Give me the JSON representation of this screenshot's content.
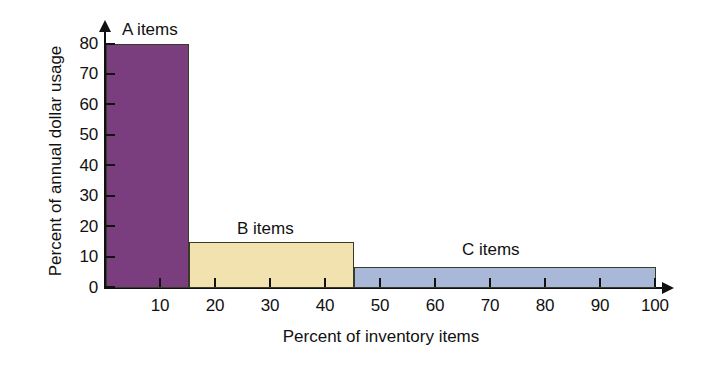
{
  "chart_data": {
    "type": "bar",
    "title": "",
    "subtitle": "",
    "xlabel": "Percent of inventory items",
    "ylabel": "Percent of annual dollar usage",
    "xlim": [
      0,
      100
    ],
    "ylim": [
      0,
      80
    ],
    "xticks": [
      10,
      20,
      30,
      40,
      50,
      60,
      70,
      80,
      90,
      100
    ],
    "yticks": [
      0,
      10,
      20,
      30,
      40,
      50,
      60,
      70,
      80
    ],
    "grid": false,
    "legend": false,
    "orientation": "vertical",
    "bars": [
      {
        "label": "A items",
        "x_start": 0,
        "x_end": 15,
        "width": 15,
        "value": 80,
        "color": "#7a3d7d"
      },
      {
        "label": "B items",
        "x_start": 15,
        "x_end": 45,
        "width": 30,
        "value": 15,
        "color": "#f2e2b0"
      },
      {
        "label": "C items",
        "x_start": 45,
        "x_end": 100,
        "width": 55,
        "value": 7,
        "color": "#a9b7d9"
      }
    ],
    "categories": [
      "A items",
      "B items",
      "C items"
    ],
    "values": [
      80,
      15,
      7
    ],
    "annotations": [
      "A items",
      "B items",
      "C items"
    ],
    "axis_style": {
      "x_arrow": true,
      "y_arrow": true,
      "tick_direction": "in",
      "axis_color": "#111111",
      "bar_outline_color": "#3a3a28"
    }
  },
  "labels": {
    "y_ticks": [
      "0",
      "10",
      "20",
      "30",
      "40",
      "50",
      "60",
      "70",
      "80"
    ],
    "x_ticks": [
      "10",
      "20",
      "30",
      "40",
      "50",
      "60",
      "70",
      "80",
      "90",
      "100"
    ],
    "series": [
      "A items",
      "B items",
      "C items"
    ],
    "x_title": "Percent of inventory items",
    "y_title": "Percent of annual dollar usage"
  }
}
